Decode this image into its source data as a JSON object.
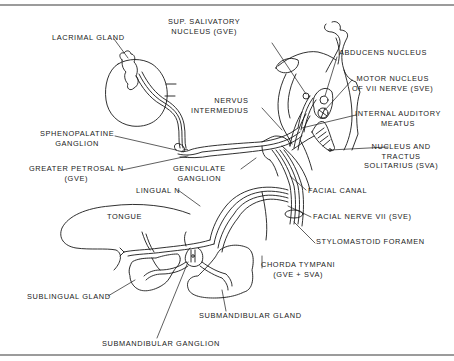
{
  "diagram": {
    "colors": {
      "ink": "#1a1a1a",
      "frame": "#7a7a7a",
      "background": "#ffffff"
    },
    "labels": {
      "lacrimal_gland": "LACRIMAL GLAND",
      "sup_salivatory_1": "SUP. SALIVATORY",
      "sup_salivatory_2": "NUCLEUS (GVE)",
      "abducens_nucleus": "ABDUCENS NUCLEUS",
      "motor_nucleus_1": "MOTOR NUCLEUS",
      "motor_nucleus_2": "OF VII NERVE (SVE)",
      "nervus_intermedius_1": "NERVUS",
      "nervus_intermedius_2": "INTERMEDIUS",
      "internal_auditory_1": "INTERNAL AUDITORY",
      "internal_auditory_2": "MEATUS",
      "sphenopalatine_1": "SPHENOPALATINE",
      "sphenopalatine_2": "GANGLION",
      "nucleus_tractus_1": "NUCLEUS AND",
      "nucleus_tractus_2": "TRACTUS",
      "nucleus_tractus_3": "SOLITARIUS (SVA)",
      "greater_petrosal_1": "GREATER PETROSAL N",
      "greater_petrosal_2": "(GVE)",
      "geniculate_1": "GENICULATE",
      "geniculate_2": "GANGLION",
      "facial_canal": "FACIAL CANAL",
      "lingual_n": "LINGUAL N",
      "facial_nerve": "FACIAL NERVE VII (SVE)",
      "tongue": "TONGUE",
      "stylomastoid": "STYLOMASTOID FORAMEN",
      "chorda_tympani_1": "CHORDA TYMPANI",
      "chorda_tympani_2": "(GVE + SVA)",
      "sublingual_gland": "SUBLINGUAL GLAND",
      "submandibular_gland": "SUBMANDIBULAR GLAND",
      "submandibular_ganglion": "SUBMANDIBULAR GANGLION"
    }
  }
}
